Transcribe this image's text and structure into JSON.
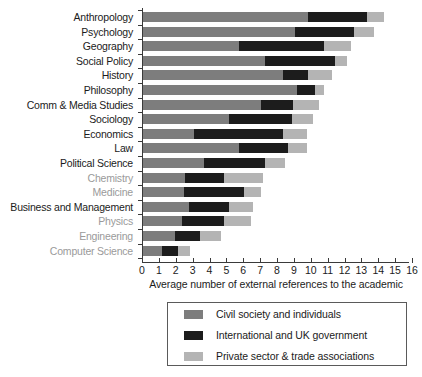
{
  "chart_data": {
    "type": "bar",
    "orientation": "horizontal",
    "stacked": true,
    "title": "",
    "xlabel": "Average number of external references to the academic",
    "ylabel": "",
    "xlim": [
      0,
      16
    ],
    "xticks": [
      0,
      1,
      2,
      3,
      4,
      5,
      6,
      7,
      8,
      9,
      10,
      11,
      12,
      13,
      14,
      15,
      16
    ],
    "grid": false,
    "legend_position": "bottom",
    "categories": [
      "Anthropology",
      "Psychology",
      "Geography",
      "Social Policy",
      "History",
      "Philosophy",
      "Comm & Media Studies",
      "Sociology",
      "Economics",
      "Law",
      "Political Science",
      "Chemistry",
      "Medicine",
      "Business and Management",
      "Physics",
      "Engineering",
      "Computer Science"
    ],
    "category_styles": [
      "dark",
      "dark",
      "dark",
      "dark",
      "dark",
      "dark",
      "dark",
      "dark",
      "dark",
      "dark",
      "dark",
      "muted",
      "muted",
      "dark",
      "muted",
      "muted",
      "muted"
    ],
    "series": [
      {
        "name": "Civil society and individuals",
        "color": "#7d7d7d",
        "values": [
          9.8,
          9.0,
          5.7,
          7.2,
          8.3,
          9.1,
          7.0,
          5.1,
          3.0,
          5.7,
          3.6,
          2.5,
          2.4,
          2.7,
          2.3,
          1.9,
          1.1
        ]
      },
      {
        "name": "International and UK government",
        "color": "#1c1c1c",
        "values": [
          3.5,
          3.5,
          5.0,
          4.2,
          1.5,
          1.1,
          1.9,
          3.7,
          5.3,
          2.9,
          3.6,
          2.3,
          3.6,
          2.4,
          2.5,
          1.5,
          1.0
        ]
      },
      {
        "name": "Private sector & trade associations",
        "color": "#b4b4b4",
        "values": [
          1.0,
          1.2,
          1.6,
          0.7,
          1.4,
          0.5,
          1.5,
          1.3,
          1.4,
          1.1,
          1.2,
          2.3,
          1.0,
          1.4,
          1.6,
          1.2,
          0.7
        ]
      }
    ],
    "totals": [
      14.3,
      13.7,
      12.3,
      12.1,
      11.2,
      10.7,
      10.4,
      10.1,
      9.7,
      9.7,
      8.4,
      7.1,
      7.0,
      6.5,
      6.4,
      4.6,
      2.8
    ]
  },
  "legend": {
    "items": [
      {
        "label": "Civil society and individuals",
        "color": "#7d7d7d"
      },
      {
        "label": "International and UK government",
        "color": "#1c1c1c"
      },
      {
        "label": "Private sector & trade associations",
        "color": "#b4b4b4"
      }
    ]
  }
}
